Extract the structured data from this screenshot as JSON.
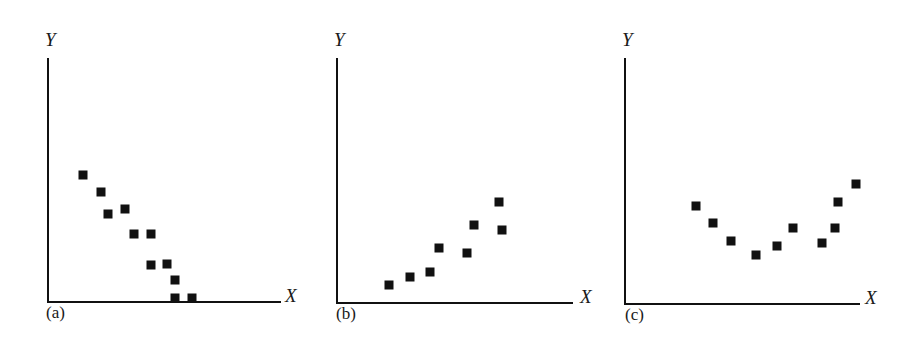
{
  "chart_data": [
    {
      "type": "scatter",
      "panel_label": "(a)",
      "xlabel": "X",
      "ylabel": "Y",
      "grid": false,
      "legend": null,
      "description": "Negative linear relationship",
      "xlim": [
        0,
        10
      ],
      "ylim": [
        0,
        10
      ],
      "axis_px": {
        "x0": 48,
        "y0": 302,
        "x1": 281,
        "ytop": 58
      },
      "points_px": [
        [
          83,
          175
        ],
        [
          101,
          192
        ],
        [
          108,
          214
        ],
        [
          125,
          209
        ],
        [
          134,
          234
        ],
        [
          151,
          234
        ],
        [
          151,
          265
        ],
        [
          167,
          264
        ],
        [
          175,
          280
        ],
        [
          175,
          298
        ],
        [
          192,
          298
        ]
      ],
      "points": [
        {
          "x": 1.5,
          "y": 5.2
        },
        {
          "x": 2.3,
          "y": 4.5
        },
        {
          "x": 2.6,
          "y": 3.6
        },
        {
          "x": 3.3,
          "y": 3.8
        },
        {
          "x": 3.7,
          "y": 2.8
        },
        {
          "x": 4.4,
          "y": 2.8
        },
        {
          "x": 4.4,
          "y": 1.5
        },
        {
          "x": 5.1,
          "y": 1.6
        },
        {
          "x": 5.5,
          "y": 0.9
        },
        {
          "x": 5.5,
          "y": 0.2
        },
        {
          "x": 6.2,
          "y": 0.2
        }
      ]
    },
    {
      "type": "scatter",
      "panel_label": "(b)",
      "xlabel": "X",
      "ylabel": "Y",
      "grid": false,
      "legend": null,
      "description": "Positive linear relationship",
      "xlim": [
        0,
        10
      ],
      "ylim": [
        0,
        10
      ],
      "axis_px": {
        "x0": 337,
        "y0": 303,
        "x1": 573,
        "ytop": 58
      },
      "points_px": [
        [
          389,
          285
        ],
        [
          410,
          277
        ],
        [
          430,
          272
        ],
        [
          439,
          248
        ],
        [
          467,
          253
        ],
        [
          474,
          225
        ],
        [
          499,
          202
        ],
        [
          502,
          230
        ]
      ],
      "points": [
        {
          "x": 2.2,
          "y": 0.7
        },
        {
          "x": 3.1,
          "y": 1.1
        },
        {
          "x": 3.9,
          "y": 1.3
        },
        {
          "x": 4.3,
          "y": 2.2
        },
        {
          "x": 5.5,
          "y": 2.0
        },
        {
          "x": 5.8,
          "y": 3.2
        },
        {
          "x": 6.9,
          "y": 4.1
        },
        {
          "x": 7.0,
          "y": 3.0
        }
      ]
    },
    {
      "type": "scatter",
      "panel_label": "(c)",
      "xlabel": "X",
      "ylabel": "Y",
      "grid": false,
      "legend": null,
      "description": "Curvilinear (U-shaped) relationship",
      "xlim": [
        0,
        10
      ],
      "ylim": [
        0,
        10
      ],
      "axis_px": {
        "x0": 625,
        "y0": 304,
        "x1": 860,
        "ytop": 58
      },
      "points_px": [
        [
          696,
          206
        ],
        [
          713,
          223
        ],
        [
          731,
          241
        ],
        [
          756,
          255
        ],
        [
          777,
          246
        ],
        [
          793,
          228
        ],
        [
          822,
          243
        ],
        [
          835,
          228
        ],
        [
          838,
          202
        ],
        [
          856,
          184
        ]
      ],
      "points": [
        {
          "x": 3.0,
          "y": 4.0
        },
        {
          "x": 3.7,
          "y": 3.3
        },
        {
          "x": 4.5,
          "y": 2.6
        },
        {
          "x": 5.6,
          "y": 2.0
        },
        {
          "x": 6.5,
          "y": 2.4
        },
        {
          "x": 7.1,
          "y": 3.1
        },
        {
          "x": 8.4,
          "y": 2.5
        },
        {
          "x": 8.9,
          "y": 3.1
        },
        {
          "x": 9.1,
          "y": 4.2
        },
        {
          "x": 9.8,
          "y": 4.9
        }
      ]
    }
  ],
  "labels": {
    "y": "Y",
    "x": "X",
    "panel_a": "(a)",
    "panel_b": "(b)",
    "panel_c": "(c)"
  },
  "style": {
    "ink": "#111111",
    "background": "#ffffff",
    "marker_size": 9
  }
}
